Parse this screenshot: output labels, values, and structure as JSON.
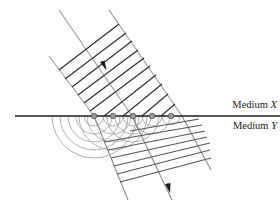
{
  "diagram": {
    "labels": {
      "medium_x_prefix": "Medium ",
      "medium_x_var": "X",
      "medium_y_prefix": "Medium ",
      "medium_y_var": "Y"
    },
    "colors": {
      "wavefront": "#2b2b2b",
      "ray": "#8c8c8c",
      "wavelet": "#a6a6a6",
      "boundary": "#1a1a1a",
      "source_dot": "#8a8a8a"
    },
    "boundary_y": 116,
    "source_points_x": [
      94,
      113,
      133,
      152,
      171
    ]
  }
}
